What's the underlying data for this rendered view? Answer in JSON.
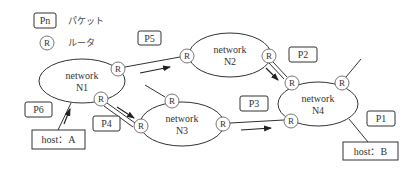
{
  "legend": {
    "packet": {
      "symbol": "Pn",
      "label": "パケット",
      "box": [
        34,
        13,
        22,
        15
      ],
      "text_x": 68,
      "text_y": 24
    },
    "router": {
      "symbol": "R",
      "label": "ルータ",
      "center": [
        47,
        43
      ],
      "text_x": 68,
      "text_y": 46
    }
  },
  "networks": [
    {
      "id": "N1",
      "line1": "network",
      "line2": "N1",
      "cx": 82,
      "cy": 81,
      "rx": 43,
      "ry": 22
    },
    {
      "id": "N2",
      "line1": "network",
      "line2": "N2",
      "cx": 230,
      "cy": 55,
      "rx": 41,
      "ry": 22
    },
    {
      "id": "N3",
      "line1": "network",
      "line2": "N3",
      "cx": 182,
      "cy": 124,
      "rx": 42,
      "ry": 22
    },
    {
      "id": "N4",
      "line1": "network",
      "line2": "N4",
      "cx": 318,
      "cy": 104,
      "rx": 40,
      "ry": 22
    }
  ],
  "routers": [
    {
      "id": "N1-R1",
      "label": "R",
      "x": 118,
      "y": 69
    },
    {
      "id": "N1-R2",
      "label": "R",
      "x": 101,
      "y": 99
    },
    {
      "id": "N2-R1",
      "label": "R",
      "x": 187,
      "y": 56
    },
    {
      "id": "N2-R2",
      "label": "R",
      "x": 269,
      "y": 56
    },
    {
      "id": "N3-R1",
      "label": "R",
      "x": 172,
      "y": 101
    },
    {
      "id": "N3-R2",
      "label": "R",
      "x": 141,
      "y": 126
    },
    {
      "id": "N3-R3",
      "label": "R",
      "x": 223,
      "y": 124
    },
    {
      "id": "N4-R1",
      "label": "R",
      "x": 292,
      "y": 83
    },
    {
      "id": "N4-R2",
      "label": "R",
      "x": 342,
      "y": 83
    },
    {
      "id": "N4-R3",
      "label": "R",
      "x": 291,
      "y": 121
    }
  ],
  "packets": [
    {
      "id": "P1",
      "label": "P1",
      "x": 367,
      "y": 111,
      "w": 28,
      "h": 15
    },
    {
      "id": "P2",
      "label": "P2",
      "x": 289,
      "y": 47,
      "w": 28,
      "h": 15
    },
    {
      "id": "P3",
      "label": "P3",
      "x": 240,
      "y": 96,
      "w": 28,
      "h": 15
    },
    {
      "id": "P4",
      "label": "P4",
      "x": 93,
      "y": 116,
      "w": 27,
      "h": 15
    },
    {
      "id": "P5",
      "label": "P5",
      "x": 138,
      "y": 31,
      "w": 23,
      "h": 14
    },
    {
      "id": "P6",
      "label": "P6",
      "x": 25,
      "y": 102,
      "w": 27,
      "h": 15
    }
  ],
  "hosts": [
    {
      "id": "host-a",
      "label": "host：A",
      "x": 32,
      "y": 130,
      "w": 53,
      "h": 19
    },
    {
      "id": "host-b",
      "label": "host：B",
      "x": 343,
      "y": 142,
      "w": 55,
      "h": 18
    }
  ],
  "links": [
    {
      "id": "N1-N2",
      "x1": 125,
      "y1": 67,
      "x2": 180,
      "y2": 57
    },
    {
      "id": "N1-N3-a",
      "x1": 107,
      "y1": 103,
      "x2": 135,
      "y2": 123
    },
    {
      "id": "N1-N3-b",
      "x1": 104,
      "y1": 106,
      "x2": 133,
      "y2": 127
    },
    {
      "id": "N3-N4",
      "x1": 230,
      "y1": 123,
      "x2": 284,
      "y2": 120
    },
    {
      "id": "N2-N4-a",
      "x1": 273,
      "y1": 62,
      "x2": 287,
      "y2": 77
    },
    {
      "id": "N2-N4-b",
      "x1": 269,
      "y1": 63,
      "x2": 284,
      "y2": 79
    },
    {
      "id": "N3-stub",
      "x1": 145,
      "y1": 85,
      "x2": 165,
      "y2": 97
    },
    {
      "id": "N4-stub",
      "x1": 346,
      "y1": 77,
      "x2": 361,
      "y2": 59
    },
    {
      "id": "hostA-N1",
      "x1": 58,
      "y1": 130,
      "x2": 71,
      "y2": 103
    },
    {
      "id": "hostB-N4",
      "x1": 349,
      "y1": 119,
      "x2": 368,
      "y2": 142
    }
  ],
  "arrows": [
    {
      "id": "arrow-N1-to-N2",
      "x1": 140,
      "y1": 73,
      "x2": 170,
      "y2": 67
    },
    {
      "id": "arrow-N1-to-N3",
      "x1": 117,
      "y1": 107,
      "x2": 134,
      "y2": 118
    },
    {
      "id": "arrow-N3-to-N4",
      "x1": 241,
      "y1": 130,
      "x2": 271,
      "y2": 128
    },
    {
      "id": "arrow-N2-to-N4",
      "x1": 266,
      "y1": 68,
      "x2": 278,
      "y2": 80
    },
    {
      "id": "arrow-hostA-to-N1",
      "x1": 64,
      "y1": 124,
      "x2": 70,
      "y2": 109
    }
  ],
  "colors": {
    "stroke": "#333333",
    "text": "#333333",
    "background": "#ffffff"
  }
}
